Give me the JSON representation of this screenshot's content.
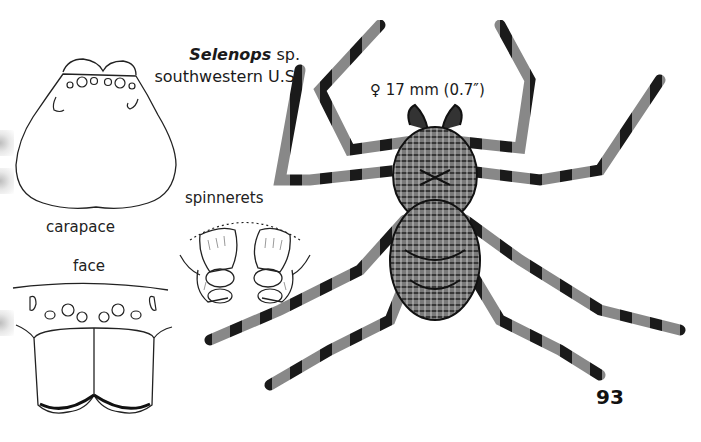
{
  "figure": {
    "species_genus": "Selenops",
    "species_suffix": " sp.",
    "region": "southwestern U.S.",
    "size_label": "♀ 17 mm (0.7″)",
    "page_number": "93"
  },
  "panels": {
    "carapace": {
      "label": "carapace"
    },
    "face": {
      "label": "face"
    },
    "spinnerets": {
      "label": "spinnerets"
    }
  },
  "icons": {
    "spider": "spider-illustration",
    "carapace": "carapace-outline-drawing",
    "face": "face-chelicerae-drawing",
    "spinnerets": "spinnerets-drawing"
  },
  "colors": {
    "ink": "#1a1a1a",
    "paper": "#ffffff"
  }
}
